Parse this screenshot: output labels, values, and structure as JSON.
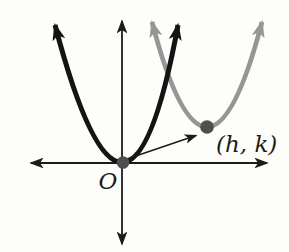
{
  "figure": {
    "labels": {
      "origin": "O",
      "translated_vertex": "(h, k)"
    },
    "colors": {
      "background": "#fdfdfa",
      "axis": "#1c1c1c",
      "black_parabola": "#141414",
      "gray_parabola": "#969696",
      "dot": "#4f4f4f",
      "translation_arrow": "#1c1c1c",
      "label_text": "#1c1c1c"
    }
  }
}
